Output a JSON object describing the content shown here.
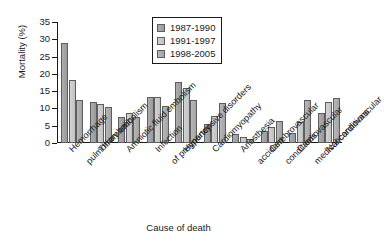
{
  "chart_data": {
    "type": "bar",
    "title": "",
    "subtitle": "",
    "xlabel": "Cause of death",
    "ylabel": "Mortality (%)",
    "ylim": [
      0,
      35
    ],
    "yticks": [
      0,
      5,
      10,
      15,
      20,
      25,
      30,
      35
    ],
    "ytick_labels": [
      "0",
      "5",
      "10",
      "15",
      "20",
      "25",
      "30",
      "35"
    ],
    "grid": false,
    "legend_position": "top-center",
    "categories": [
      "Hemorrhage",
      "Thrombotic pulmonary embolism",
      "Amniotic fluid embolism",
      "Infection",
      "Hypertensive disorders of pregnancy",
      "Cardiomyopathy",
      "Anesthesia",
      "Cerebrovascular accident",
      "Cardiovascular conditions",
      "Noncardiovascular medical conditions"
    ],
    "category_label_lines": [
      [
        "Hemorrhage"
      ],
      [
        "Thrombotic",
        "pulmonary embolism"
      ],
      [
        "Amniotic fluid embolism"
      ],
      [
        "Infection"
      ],
      [
        "Hypertensive disorders",
        "of pregnancy"
      ],
      [
        "Cardiomyopathy"
      ],
      [
        "Anesthesia"
      ],
      [
        "Cerebrovascular",
        "accident"
      ],
      [
        "Cardiovascular",
        "conditions"
      ],
      [
        "Noncardiovascular",
        "medical conditions"
      ]
    ],
    "series": [
      {
        "name": "1987-1990",
        "color": "#a3a3a3",
        "values": [
          28.9,
          11.9,
          7.6,
          13.3,
          17.6,
          5.5,
          2.5,
          3.6,
          2.9,
          8.8
        ]
      },
      {
        "name": "1991-1997",
        "color": "#cccccc",
        "values": [
          18.3,
          11.4,
          8.6,
          13.3,
          15.9,
          7.8,
          1.6,
          4.6,
          6.1,
          12.0
        ]
      },
      {
        "name": "1998-2005",
        "color": "#b0b0b0",
        "values": [
          12.5,
          10.3,
          7.4,
          10.7,
          12.3,
          11.5,
          1.2,
          6.3,
          12.4,
          13.1
        ]
      }
    ]
  },
  "legend": {
    "entries": [
      {
        "label": "1987-1990"
      },
      {
        "label": "1991-1997"
      },
      {
        "label": "1998-2005"
      }
    ]
  },
  "axes": {
    "y_title": "Mortality (%)",
    "x_title": "Cause of death"
  }
}
